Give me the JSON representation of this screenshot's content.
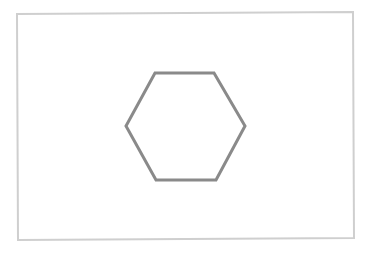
{
  "canvas": {
    "width": 370,
    "height": 253,
    "background": "#ffffff"
  },
  "frame": {
    "points": "17,14 353,12 354,238 18,240",
    "stroke": "#cfcfcf",
    "stroke_width": 2
  },
  "hexagon": {
    "shape": "hexagon",
    "points": "155,73 214,73 245,126 216,180 156,180 126,126",
    "stroke": "#8a8a8a",
    "stroke_width": 3,
    "fill": "none"
  }
}
